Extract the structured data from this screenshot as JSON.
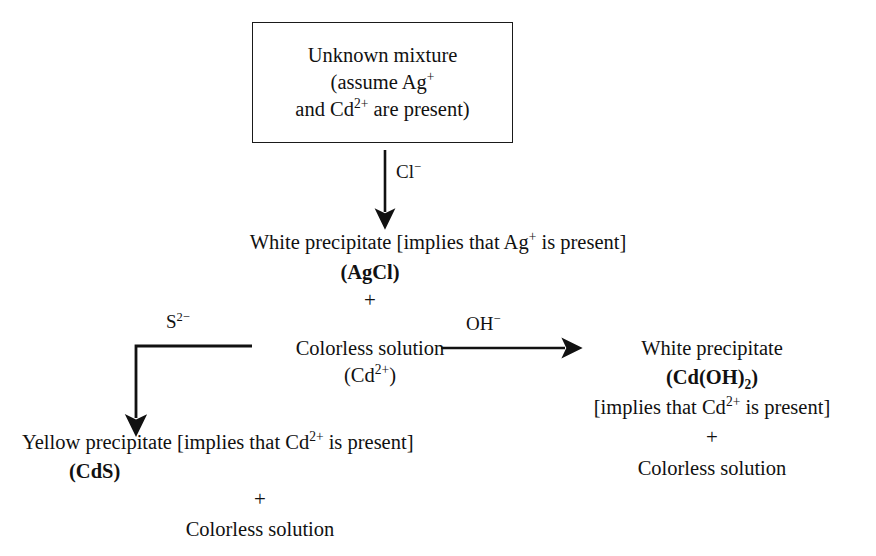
{
  "figure": {
    "kind": "qualitative-analysis-flowchart",
    "background_color": "#ffffff",
    "ink_color": "#111111"
  },
  "start_box": {
    "line1": "Unknown mixture",
    "line2_prefix": "(assume Ag",
    "line2_charge": "+",
    "line3_prefix": "and Cd",
    "line3_charge": "2+",
    "line3_suffix": " are present)"
  },
  "arrows": {
    "chloride": {
      "reagent_label": "Cl",
      "reagent_charge": "−",
      "direction": "down"
    },
    "sulfide": {
      "reagent_label": "S",
      "reagent_charge": "2−",
      "direction": "left-then-down"
    },
    "hydroxide": {
      "reagent_label": "OH",
      "reagent_charge": "−",
      "direction": "right"
    }
  },
  "step_agcl": {
    "line1_prefix": "White precipitate [implies that Ag",
    "line1_charge": "+",
    "line1_suffix": " is present]",
    "formula": "(AgCl)",
    "plus": "+"
  },
  "step_solution": {
    "line1": "Colorless solution",
    "line2_prefix": "(Cd",
    "line2_charge": "2+",
    "line2_suffix": ")"
  },
  "branch_sulfide": {
    "line1_prefix": "Yellow precipitate [implies that Cd",
    "line1_charge": "2+",
    "line1_suffix": " is present]",
    "formula": "(CdS)",
    "plus": "+",
    "final": "Colorless solution"
  },
  "branch_hydroxide": {
    "line1": "White precipitate",
    "formula_prefix": "(Cd(OH)",
    "formula_sub": "2",
    "formula_suffix": ")",
    "line3_prefix": "[implies that Cd",
    "line3_charge": "2+",
    "line3_suffix": " is present]",
    "plus": "+",
    "final": "Colorless solution"
  }
}
